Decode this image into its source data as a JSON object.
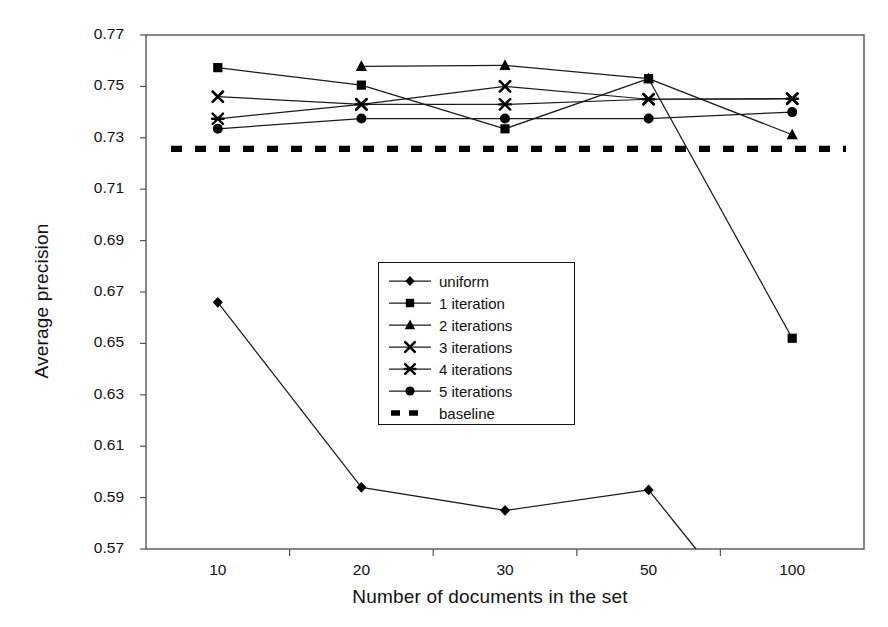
{
  "chart_data": {
    "type": "line",
    "title": "",
    "xlabel": "Number of documents in the set",
    "ylabel": "Average precision",
    "categories": [
      "10",
      "20",
      "30",
      "50",
      "100"
    ],
    "xticklabels": [
      "10",
      "20",
      "30",
      "50",
      "100"
    ],
    "yticklabels": [
      "0.57",
      "0.59",
      "0.61",
      "0.63",
      "0.65",
      "0.67",
      "0.69",
      "0.71",
      "0.73",
      "0.75",
      "0.77"
    ],
    "yticks": [
      0.57,
      0.59,
      0.61,
      0.63,
      0.65,
      0.67,
      0.69,
      0.71,
      0.73,
      0.75,
      0.77
    ],
    "ylim": [
      0.57,
      0.77
    ],
    "grid": false,
    "legend_position": "center",
    "series": [
      {
        "name": "uniform",
        "marker": "diamond",
        "values": [
          0.666,
          0.594,
          0.585,
          0.593,
          null
        ],
        "clipped_below_axis": true,
        "note": "drops below axis minimum after x=50"
      },
      {
        "name": "1 iteration",
        "marker": "square",
        "values": [
          0.7573,
          0.7505,
          0.7335,
          0.753,
          0.652
        ]
      },
      {
        "name": "2 iterations",
        "marker": "triangle",
        "values": [
          null,
          0.7578,
          0.7582,
          0.753,
          0.7312
        ]
      },
      {
        "name": "3 iterations",
        "marker": "cross",
        "values": [
          0.746,
          0.743,
          0.75,
          0.745,
          0.7452
        ]
      },
      {
        "name": "4 iterations",
        "marker": "asterisk",
        "values": [
          0.7374,
          0.743,
          0.743,
          0.745,
          0.7452
        ]
      },
      {
        "name": "5 iterations",
        "marker": "circle",
        "values": [
          0.7335,
          0.7375,
          0.7375,
          0.7375,
          0.74
        ]
      },
      {
        "name": "baseline",
        "marker": "none",
        "linestyle": "dashed",
        "constant": 0.7257,
        "values": [
          0.7257,
          0.7257,
          0.7257,
          0.7257,
          0.7257
        ]
      }
    ]
  },
  "legend": {
    "items": [
      {
        "label": "uniform",
        "marker": "diamond"
      },
      {
        "label": "1 iteration",
        "marker": "square"
      },
      {
        "label": "2 iterations",
        "marker": "triangle"
      },
      {
        "label": "3 iterations",
        "marker": "cross"
      },
      {
        "label": "4 iterations",
        "marker": "asterisk"
      },
      {
        "label": "5 iterations",
        "marker": "circle"
      },
      {
        "label": "baseline",
        "marker": "dashed"
      }
    ]
  },
  "colors": {
    "line": "#1a1a1a",
    "marker": "#000000",
    "axis": "#555555",
    "background": "#ffffff"
  }
}
